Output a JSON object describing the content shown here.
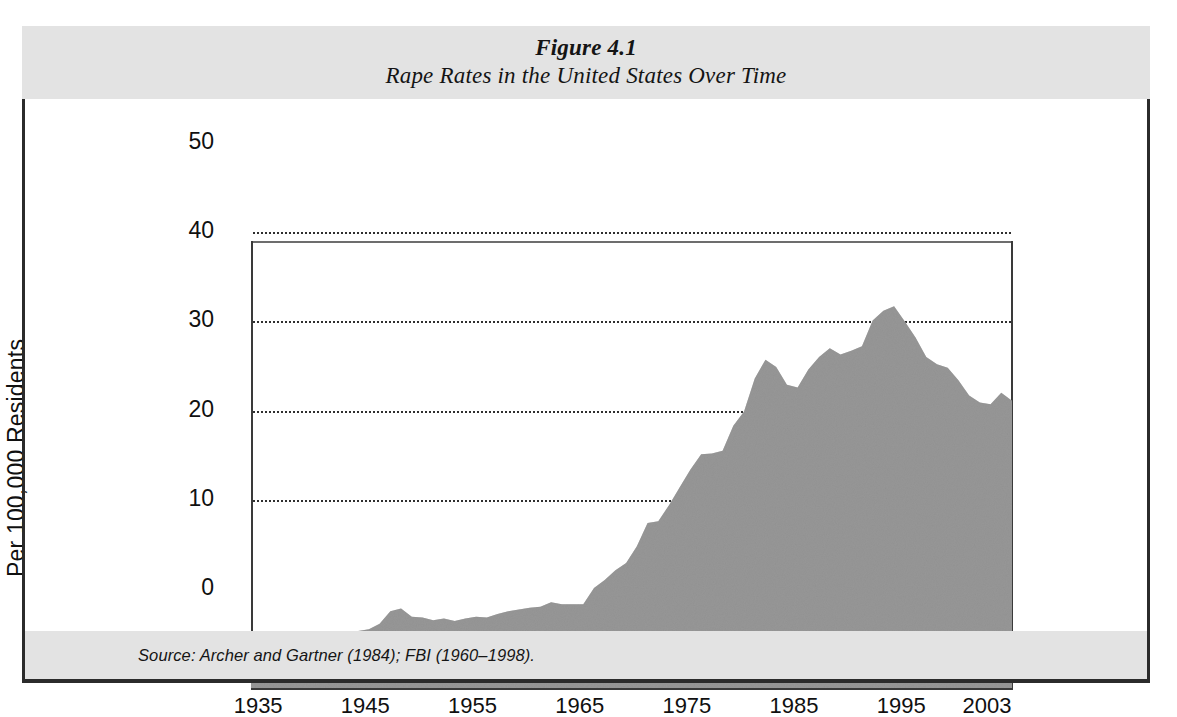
{
  "figure": {
    "number": "Figure 4.1",
    "title": "Rape Rates in the United States Over Time",
    "source": "Source:  Archer and Gartner (1984); FBI (1960–1998)."
  },
  "colors": {
    "band_background": "#e3e3e3",
    "area_fill": "#a2a2a2",
    "axis": "#3a3a3a",
    "gridline": "#2f2f2f",
    "frame": "#2b2b2b",
    "text": "#101010"
  },
  "chart_data": {
    "type": "area",
    "title": "Rape Rates in the United States Over Time",
    "xlabel": "",
    "ylabel": "Per 100,000 Residents",
    "xlim": [
      1932,
      2003
    ],
    "ylim": [
      0,
      50
    ],
    "grid": true,
    "gridlines_y": [
      10,
      20,
      30,
      40
    ],
    "legend": "none",
    "ytick_labels": [
      "0",
      "10",
      "20",
      "30",
      "40",
      "50"
    ],
    "yticks": [
      0,
      10,
      20,
      30,
      40,
      50
    ],
    "xtick_labels": [
      "1935",
      "1945",
      "1955",
      "1965",
      "1975",
      "1985",
      "1995",
      "2003"
    ],
    "xticks": [
      1935,
      1945,
      1955,
      1965,
      1975,
      1985,
      1995,
      2003
    ],
    "series_name": "Rape rate per 100,000 residents",
    "x": [
      1932,
      1933,
      1934,
      1935,
      1936,
      1937,
      1938,
      1939,
      1940,
      1941,
      1942,
      1943,
      1944,
      1945,
      1946,
      1947,
      1948,
      1949,
      1950,
      1951,
      1952,
      1953,
      1954,
      1955,
      1956,
      1957,
      1958,
      1959,
      1960,
      1961,
      1962,
      1963,
      1964,
      1965,
      1966,
      1967,
      1968,
      1969,
      1970,
      1971,
      1972,
      1973,
      1974,
      1975,
      1976,
      1977,
      1978,
      1979,
      1980,
      1981,
      1982,
      1983,
      1984,
      1985,
      1986,
      1987,
      1988,
      1989,
      1990,
      1991,
      1992,
      1993,
      1994,
      1995,
      1996,
      1997,
      1998,
      1999,
      2000,
      2001,
      2002,
      2003
    ],
    "values": [
      3.6,
      4.3,
      5.0,
      5.5,
      5.2,
      6.0,
      5.7,
      5.6,
      5.7,
      6.1,
      6.4,
      6.6,
      7.2,
      8.6,
      8.9,
      8.0,
      7.9,
      7.6,
      7.8,
      7.5,
      7.8,
      8.0,
      7.9,
      8.3,
      8.6,
      8.8,
      9.0,
      9.1,
      9.6,
      9.4,
      9.4,
      9.4,
      11.2,
      12.1,
      13.2,
      14.0,
      15.9,
      18.5,
      18.7,
      20.5,
      22.5,
      24.5,
      26.2,
      26.3,
      26.6,
      29.4,
      31.0,
      34.7,
      36.8,
      36.0,
      34.0,
      33.7,
      35.7,
      37.1,
      38.1,
      37.4,
      37.8,
      38.3,
      41.2,
      42.3,
      42.8,
      41.1,
      39.3,
      37.1,
      36.3,
      35.9,
      34.5,
      32.8,
      32.0,
      31.8,
      33.1,
      32.2
    ]
  }
}
